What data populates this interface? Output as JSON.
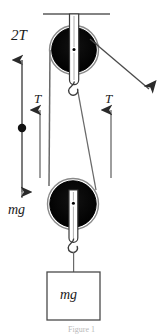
{
  "figure": {
    "kind": "free-body-pulley-diagram",
    "caption_fragment": "Figure 1",
    "colors": {
      "ink": "#1a1a1a",
      "pulley_fill": "#000000",
      "rim": "#6e6e6e",
      "rope": "#555555",
      "background": "#ffffff"
    }
  },
  "labels": {
    "tension_total": "2T",
    "tension_left": "T",
    "tension_right": "T",
    "weight_axis": "mg",
    "block_weight": "mg"
  },
  "elements": {
    "ceiling": "ceiling-support",
    "upper_pulley": "fixed-pulley",
    "lower_pulley": "movable-pulley",
    "upper_hook": "hook",
    "lower_hook": "hook",
    "block": "hanging-block",
    "pull_arrow": "applied-force-arrow",
    "axis": "force-axis"
  },
  "geometry": {
    "ceiling": {
      "x1": 43,
      "x2": 110,
      "y": 14
    },
    "upper_pulley": {
      "cx": 74,
      "cy": 50,
      "r": 24
    },
    "lower_pulley": {
      "cx": 73,
      "cy": 204,
      "r": 25
    },
    "block": {
      "x": 47,
      "y": 272,
      "w": 53,
      "h": 48
    },
    "axis": {
      "x": 22,
      "y_top": 56,
      "y_bottom": 198,
      "dot_y": 128
    },
    "arrow_left": {
      "x": 40,
      "y_top": 107,
      "y_bottom": 178
    },
    "arrow_right": {
      "x": 111,
      "y_top": 107,
      "y_bottom": 178
    },
    "pull_arrow": {
      "x1": 90,
      "y1": 40,
      "x2": 151,
      "y2": 92
    }
  }
}
